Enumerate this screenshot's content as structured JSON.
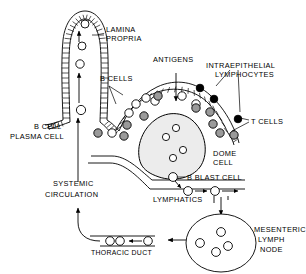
{
  "figure": {
    "labels": {
      "lamina_propria_line1": "LAMINA",
      "lamina_propria_line2": "PROPRIA",
      "b_cells": "B CELLS",
      "antigens": "ANTIGENS",
      "intraepithelial_line1": "INTRAEPITHELIAL",
      "intraepithelial_line2": "LYMPHOCYTES",
      "t_cells": "T CELLS",
      "b_cell_plasma_line1": "B CELL",
      "b_cell_plasma_line2": "PLASMA CELL",
      "dome_cell_line1": "DOME",
      "dome_cell_line2": "CELL",
      "b_blast_cell": "B BLAST CELL",
      "lymphatics": "LYMPHATICS",
      "systemic_line1": "SYSTEMIC",
      "systemic_line2": "CIRCULATION",
      "thoracic_duct": "THORACIC DUCT",
      "mesenteric_line1": "MESENTERIC",
      "mesenteric_line2": "LYMPH",
      "mesenteric_line3": "NODE"
    },
    "colors": {
      "ink": "#000000",
      "paper": "#ffffff",
      "cell_gray": "#9a9a9a",
      "dome_fill": "#ececec"
    },
    "cell_types": {
      "white_circle": "b-cell",
      "gray_circle": "t-cell",
      "black_circle": "intraepithelial-lymphocyte"
    }
  }
}
